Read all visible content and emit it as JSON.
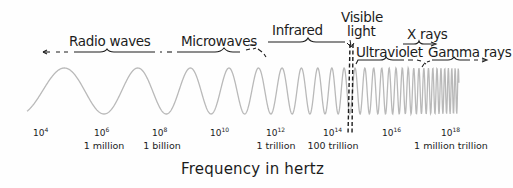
{
  "diagram": {
    "axis_title": "Frequency in hertz",
    "bands": [
      {
        "id": "radio",
        "label": "Radio waves",
        "x": 69,
        "y": 35
      },
      {
        "id": "microwave",
        "label": "Microwaves",
        "x": 181,
        "y": 35
      },
      {
        "id": "infrared",
        "label": "Infrared",
        "x": 272,
        "y": 24
      },
      {
        "id": "visible-1",
        "label": "Visible",
        "x": 341,
        "y": 11
      },
      {
        "id": "visible-2",
        "label": "light",
        "x": 347,
        "y": 25
      },
      {
        "id": "xray",
        "label": "X rays",
        "x": 407,
        "y": 28
      },
      {
        "id": "ultraviolet",
        "label": "Ultraviolet",
        "x": 356,
        "y": 46
      },
      {
        "id": "gamma",
        "label": "Gamma rays",
        "x": 428,
        "y": 46
      }
    ],
    "ticks": [
      {
        "base": "10",
        "exp": "4",
        "word": "",
        "x": 41
      },
      {
        "base": "10",
        "exp": "6",
        "word": "1 million",
        "x": 102
      },
      {
        "base": "10",
        "exp": "8",
        "word": "1 billion",
        "x": 160
      },
      {
        "base": "10",
        "exp": "10",
        "word": "",
        "x": 218
      },
      {
        "base": "10",
        "exp": "12",
        "word": "1 trillion",
        "x": 274
      },
      {
        "base": "10",
        "exp": "14",
        "word": "100 trillion",
        "x": 331
      },
      {
        "base": "10",
        "exp": "16",
        "word": "",
        "x": 390
      },
      {
        "base": "10",
        "exp": "18",
        "word": "1 million trillion",
        "x": 449
      }
    ],
    "colors": {
      "wave": "#b9b9b9",
      "ink": "#1c1c1c",
      "background": "#fefefe"
    }
  }
}
